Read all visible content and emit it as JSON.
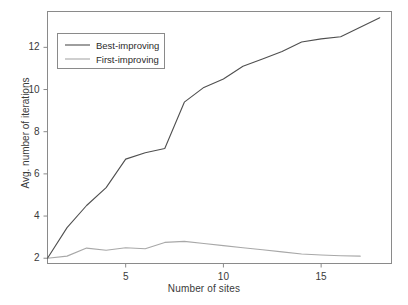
{
  "chart_data": {
    "type": "line",
    "title": "",
    "subtitle": "",
    "xlabel": "Number of sites",
    "ylabel": "Avg. number of iterations",
    "xlim": [
      1,
      18.6
    ],
    "ylim": [
      1.75,
      13.7
    ],
    "xticks": [
      5,
      10,
      15
    ],
    "yticks": [
      2,
      4,
      6,
      8,
      10,
      12
    ],
    "xtick_labels": [
      "5",
      "10",
      "15"
    ],
    "ytick_labels": [
      "2",
      "4",
      "6",
      "8",
      "10",
      "12"
    ],
    "grid": false,
    "legend_position": "top-left",
    "legend_entries": [
      "Best-improving",
      "First-improving"
    ],
    "series": [
      {
        "name": "Best-improving",
        "color": "#4f4f4f",
        "x": [
          1,
          2,
          3,
          4,
          5,
          6,
          7,
          8,
          9,
          10,
          11,
          12,
          13,
          14,
          15,
          16,
          17,
          18
        ],
        "values": [
          2.0,
          3.45,
          4.5,
          5.35,
          6.7,
          7.0,
          7.2,
          9.4,
          10.1,
          10.5,
          11.1,
          11.45,
          11.8,
          12.25,
          12.4,
          12.5,
          12.95,
          13.4
        ]
      },
      {
        "name": "First-improving",
        "color": "#a8a8a8",
        "x": [
          1,
          2,
          3,
          4,
          5,
          6,
          7,
          8,
          9,
          10,
          11,
          12,
          13,
          14,
          15,
          16,
          17
        ],
        "values": [
          2.0,
          2.1,
          2.48,
          2.38,
          2.5,
          2.45,
          2.75,
          2.8,
          2.7,
          2.6,
          2.5,
          2.4,
          2.3,
          2.2,
          2.15,
          2.12,
          2.1
        ]
      }
    ]
  },
  "axes": {
    "frame_color": "#8a8a8a",
    "tick_color": "#8a8a8a"
  }
}
